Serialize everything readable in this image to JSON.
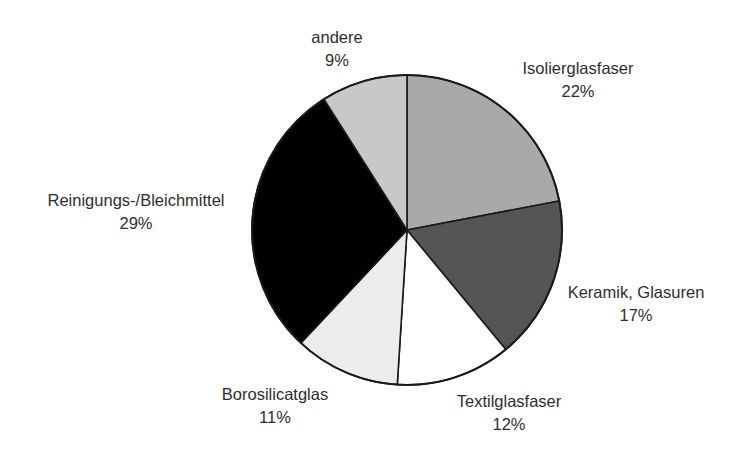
{
  "chart_data": {
    "type": "pie",
    "title": "",
    "start_angle_deg": 0,
    "direction": "clockwise",
    "slices": [
      {
        "label": "Isolierglasfaser",
        "value": 22,
        "value_label": "22%",
        "color": "#a9a9a9",
        "label_pos": [
          578,
          68
        ]
      },
      {
        "label": "Keramik, Glasuren",
        "value": 17,
        "value_label": "17%",
        "color": "#555555",
        "label_pos": [
          636,
          292
        ]
      },
      {
        "label": "Textilglasfaser",
        "value": 12,
        "value_label": "12%",
        "color": "#ffffff",
        "label_pos": [
          509,
          401
        ]
      },
      {
        "label": "Borosilicatglas",
        "value": 11,
        "value_label": "11%",
        "color": "#ececec",
        "label_pos": [
          275,
          394
        ]
      },
      {
        "label": "Reinigungs-/Bleichmittel",
        "value": 29,
        "value_label": "29%",
        "color": "#000000",
        "label_pos": [
          136,
          200
        ]
      },
      {
        "label": "andere",
        "value": 9,
        "value_label": "9%",
        "color": "#c8c8c8",
        "label_pos": [
          337,
          37
        ]
      }
    ],
    "labels": [
      "Isolierglasfaser",
      "Keramik, Glasuren",
      "Textilglasfaser",
      "Borosilicatglas",
      "Reinigungs-/Bleichmittel",
      "andere"
    ],
    "values": [
      22,
      17,
      12,
      11,
      29,
      9
    ],
    "unit": "%",
    "legend": "none (direct labels)"
  },
  "geometry": {
    "cx": 407,
    "cy": 230,
    "r": 155
  }
}
